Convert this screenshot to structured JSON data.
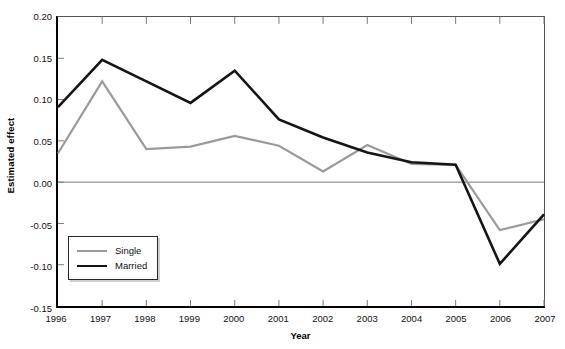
{
  "chart_data": {
    "type": "line",
    "title": "",
    "xlabel": "Year",
    "ylabel": "Estimated effect",
    "x": [
      1996,
      1997,
      1998,
      1999,
      2000,
      2001,
      2002,
      2003,
      2004,
      2005,
      2006,
      2007
    ],
    "x_tick_labels": [
      "1996",
      "1997",
      "1998",
      "1999",
      "2000",
      "2001",
      "2002",
      "2003",
      "2004",
      "2005",
      "2006",
      "2007"
    ],
    "xlim": [
      1996,
      2007
    ],
    "ylim": [
      -0.15,
      0.2
    ],
    "y_ticks": [
      0.2,
      0.15,
      0.1,
      0.05,
      0.0,
      -0.05,
      -0.1,
      -0.15
    ],
    "y_tick_labels": [
      "0.20",
      "0.15",
      "0.10",
      "0.05",
      "0.00",
      "-0.05",
      "-0.10",
      "-0.15"
    ],
    "grid": false,
    "zero_line": true,
    "legend_position": "lower-left-inside",
    "series": [
      {
        "name": "Single",
        "color": "#9a9a9a",
        "width": 2.2,
        "values": [
          0.035,
          0.122,
          0.04,
          0.043,
          0.056,
          0.044,
          0.013,
          0.045,
          0.022,
          0.021,
          -0.058,
          -0.045
        ]
      },
      {
        "name": "Married",
        "color": "#151515",
        "width": 2.6,
        "values": [
          0.091,
          0.148,
          0.122,
          0.096,
          0.135,
          0.076,
          0.054,
          0.036,
          0.024,
          0.021,
          -0.099,
          -0.039
        ]
      }
    ]
  },
  "legend": {
    "items": [
      {
        "label": "Single",
        "swatch": "gray-line-swatch"
      },
      {
        "label": "Married",
        "swatch": "black-line-swatch"
      }
    ]
  },
  "axes": {
    "y_title": "Estimated effect",
    "x_title": "Year"
  }
}
